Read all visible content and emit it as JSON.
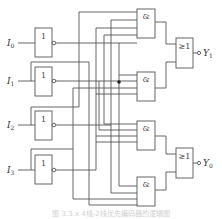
{
  "diagram": {
    "inputs": [
      {
        "label": "I",
        "sub": "0"
      },
      {
        "label": "I",
        "sub": "1"
      },
      {
        "label": "I",
        "sub": "2"
      },
      {
        "label": "I",
        "sub": "3"
      }
    ],
    "outputs": [
      {
        "label": "Y",
        "sub": "1"
      },
      {
        "label": "Y",
        "sub": "0"
      }
    ],
    "gates": {
      "not_symbol": "1",
      "and_symbol": "&",
      "or_symbol": "≥1"
    },
    "caption": "图 3.3.x  4线-2线优先编码器的逻辑图"
  }
}
